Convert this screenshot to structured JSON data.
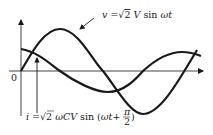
{
  "diagram": {
    "title": "",
    "origin_label": "0",
    "voltage_label": {
      "var": "v",
      "eq": " =",
      "sqrt": "√",
      "two": "2",
      "rest_V": " V",
      "rest_sin": " sin ",
      "rest_wt": "ωt"
    },
    "current_label": {
      "var": "i",
      "eq": " =",
      "sqrt": "√",
      "two": "2",
      "wCV": " ωCV",
      "sin": " sin (",
      "wt": "ωt",
      "plus": "+",
      "pi": "π",
      "den": "2",
      "close": ")"
    },
    "curves": [
      {
        "name": "voltage",
        "expression": "v = √2 V sin ωt",
        "phase": "0"
      },
      {
        "name": "current",
        "expression": "i = √2 ωCV sin(ωt + π/2)",
        "phase": "π/2"
      }
    ],
    "colors": {
      "line": "#1a1a1a",
      "text": "#222222",
      "background": "#ffffff"
    }
  }
}
